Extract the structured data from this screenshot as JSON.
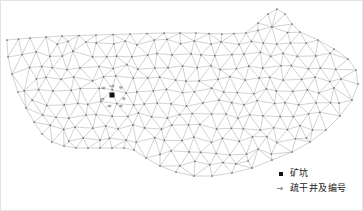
{
  "figure": {
    "kind": "finite-element-mesh-map",
    "background_color": "#ffffff",
    "frame_color": "#e3e3e3",
    "mesh_line_color": "#9a9a9a",
    "mesh_node_color": "#6e6e6e",
    "mine_pit_color": "#111111"
  },
  "legend": {
    "items": [
      {
        "symbol": "filled-square-marker",
        "label": "矿坑"
      },
      {
        "symbol": "well-marker",
        "label": "疏干井及编号"
      }
    ]
  },
  "map": {
    "mine_pit": {
      "x": 112,
      "y": 95
    },
    "well_labels": [
      {
        "text": "S4",
        "x": 101,
        "y": 87
      },
      {
        "text": "S3",
        "x": 110,
        "y": 85
      },
      {
        "text": "S2",
        "x": 119,
        "y": 86
      },
      {
        "text": "S5",
        "x": 100,
        "y": 98
      },
      {
        "text": "S1",
        "x": 122,
        "y": 97
      },
      {
        "text": "S6",
        "x": 107,
        "y": 105
      },
      {
        "text": "S7",
        "x": 119,
        "y": 105
      }
    ],
    "wells": [
      {
        "x": 104,
        "y": 88
      },
      {
        "x": 113,
        "y": 86
      },
      {
        "x": 121,
        "y": 88
      },
      {
        "x": 103,
        "y": 99
      },
      {
        "x": 124,
        "y": 99
      },
      {
        "x": 110,
        "y": 106
      },
      {
        "x": 121,
        "y": 106
      }
    ]
  },
  "chart_data": {
    "type": "mesh",
    "title": "",
    "xlabel": "",
    "ylabel": "",
    "boundary": [
      [
        7,
        40
      ],
      [
        30,
        38
      ],
      [
        62,
        36
      ],
      [
        96,
        35
      ],
      [
        130,
        34
      ],
      [
        164,
        33
      ],
      [
        196,
        33
      ],
      [
        222,
        34
      ],
      [
        246,
        33
      ],
      [
        258,
        23
      ],
      [
        268,
        14
      ],
      [
        277,
        9
      ],
      [
        285,
        14
      ],
      [
        292,
        24
      ],
      [
        300,
        32
      ],
      [
        318,
        40
      ],
      [
        334,
        49
      ],
      [
        348,
        59
      ],
      [
        356,
        70
      ],
      [
        358,
        84
      ],
      [
        352,
        100
      ],
      [
        340,
        116
      ],
      [
        326,
        130
      ],
      [
        310,
        142
      ],
      [
        292,
        152
      ],
      [
        272,
        160
      ],
      [
        252,
        168
      ],
      [
        232,
        173
      ],
      [
        212,
        176
      ],
      [
        194,
        176
      ],
      [
        176,
        172
      ],
      [
        160,
        166
      ],
      [
        146,
        158
      ],
      [
        134,
        150
      ],
      [
        124,
        148
      ],
      [
        112,
        148
      ],
      [
        100,
        148
      ],
      [
        88,
        148
      ],
      [
        76,
        148
      ],
      [
        64,
        146
      ],
      [
        52,
        142
      ],
      [
        42,
        134
      ],
      [
        34,
        122
      ],
      [
        26,
        108
      ],
      [
        18,
        92
      ],
      [
        12,
        74
      ],
      [
        8,
        57
      ]
    ],
    "notch": [
      [
        255,
        25
      ],
      [
        262,
        40
      ],
      [
        266,
        58
      ],
      [
        262,
        72
      ],
      [
        254,
        62
      ],
      [
        250,
        46
      ]
    ],
    "node_count": 241,
    "triangle_count": 420,
    "grid": false,
    "legend_position": "bottom-right"
  }
}
